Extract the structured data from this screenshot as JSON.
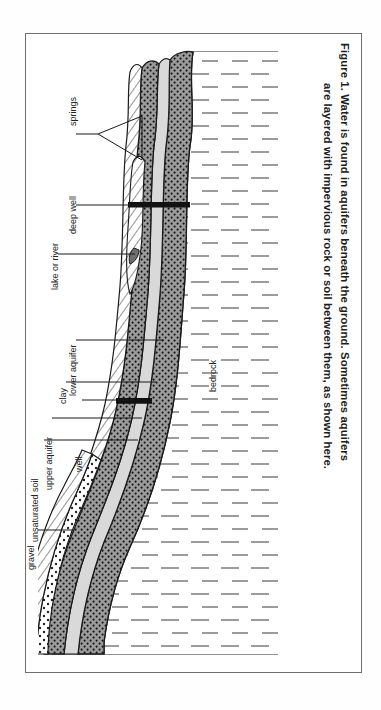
{
  "figure": {
    "caption_line1": "Figure 1.  Water is found in aquifers beneath the ground.  Sometimes aquifers",
    "caption_line2": "are layered with impervious rock or soil between them, as shown here."
  },
  "diagram": {
    "orientation": "rotated-90-clockwise",
    "labels": [
      {
        "id": "springs",
        "text": "springs"
      },
      {
        "id": "deep-well",
        "text": "deep well"
      },
      {
        "id": "lake-or-river",
        "text": "lake or river"
      },
      {
        "id": "lower-aquifer",
        "text": "lower aquifer"
      },
      {
        "id": "clay",
        "text": "clay"
      },
      {
        "id": "upper-aquifer",
        "text": "upper aquifer"
      },
      {
        "id": "unsaturated-soil",
        "text": "unsaturated soil"
      },
      {
        "id": "well",
        "text": "well"
      },
      {
        "id": "gravel",
        "text": "gravel"
      },
      {
        "id": "bedrock",
        "text": "bedrock"
      }
    ],
    "layers": [
      {
        "id": "unsaturated-soil",
        "fill": "diagonal-hatch",
        "color": "#ffffff"
      },
      {
        "id": "upper-aquifer",
        "fill": "stipple-dots",
        "color": "#9b9b9b"
      },
      {
        "id": "clay",
        "fill": "solid-light",
        "color": "#d8d8d8"
      },
      {
        "id": "lower-aquifer",
        "fill": "stipple-dots",
        "color": "#9b9b9b"
      },
      {
        "id": "gravel",
        "fill": "coarse-dots",
        "color": "#ffffff"
      },
      {
        "id": "bedrock",
        "fill": "dash-ticks",
        "color": "#ffffff"
      }
    ],
    "colors": {
      "aquifer": "#9a9a9a",
      "clay": "#d9d9d9",
      "line": "#1a1a1a",
      "frame": "#6e6e6e",
      "background": "#ffffff"
    }
  }
}
